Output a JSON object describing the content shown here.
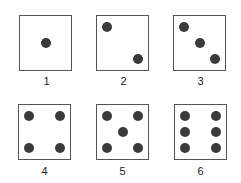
{
  "figure": {
    "dice": [
      {
        "label": "1",
        "pips": [
          [
            50,
            50
          ]
        ]
      },
      {
        "label": "2",
        "pips": [
          [
            20,
            20
          ],
          [
            80,
            80
          ]
        ]
      },
      {
        "label": "3",
        "pips": [
          [
            20,
            20
          ],
          [
            50,
            50
          ],
          [
            80,
            80
          ]
        ]
      },
      {
        "label": "4",
        "pips": [
          [
            20,
            20
          ],
          [
            80,
            20
          ],
          [
            20,
            80
          ],
          [
            80,
            80
          ]
        ]
      },
      {
        "label": "5",
        "pips": [
          [
            20,
            20
          ],
          [
            80,
            20
          ],
          [
            50,
            50
          ],
          [
            20,
            80
          ],
          [
            80,
            80
          ]
        ]
      },
      {
        "label": "6",
        "pips": [
          [
            20,
            20
          ],
          [
            80,
            20
          ],
          [
            20,
            50
          ],
          [
            80,
            50
          ],
          [
            20,
            80
          ],
          [
            80,
            80
          ]
        ]
      }
    ],
    "colors": {
      "pip": "#3a3a3a",
      "border": "#555555",
      "background": "#ffffff"
    }
  }
}
